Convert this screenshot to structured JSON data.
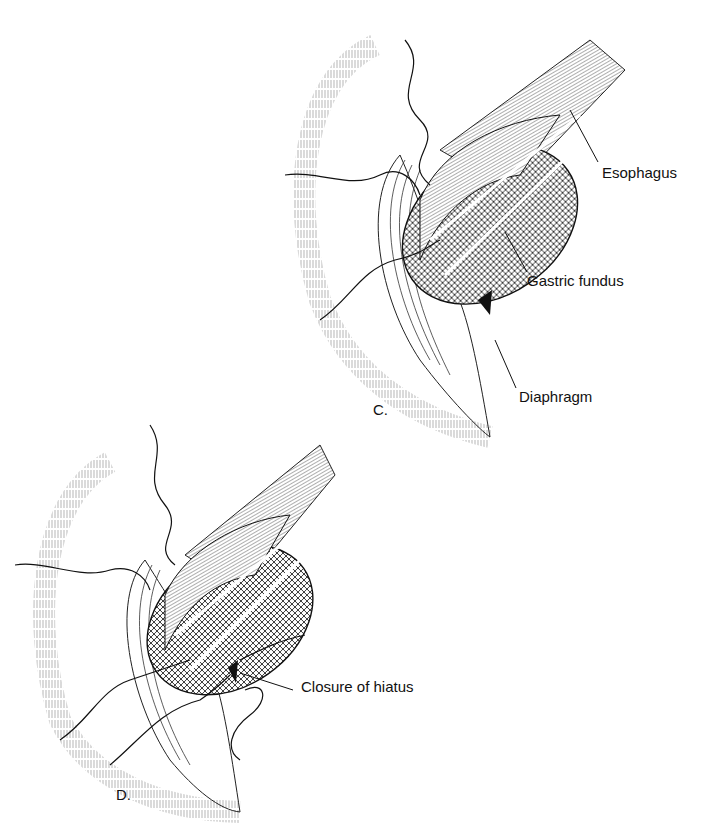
{
  "figure": {
    "panels": [
      {
        "id": "C",
        "letter": "C.",
        "labels": [
          {
            "text": "Esophagus",
            "x": 602,
            "y": 173
          },
          {
            "text": "Gastric fundus",
            "x": 527,
            "y": 281
          },
          {
            "text": "Diaphragm",
            "x": 519,
            "y": 397
          }
        ]
      },
      {
        "id": "D",
        "letter": "D.",
        "labels": [
          {
            "text": "Closure of hiatus",
            "x": 301,
            "y": 687
          }
        ]
      }
    ]
  },
  "colors": {
    "ink": "#111111",
    "background": "#ffffff"
  }
}
